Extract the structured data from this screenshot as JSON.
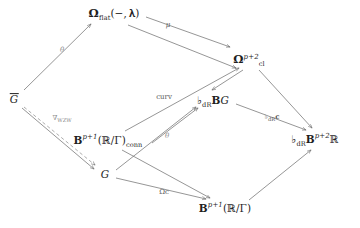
{
  "diagram": {
    "kind": "commutative-diagram",
    "nodes": [
      {
        "id": "omega-flat",
        "label": "Ω_flat(−, 𝔤)",
        "x": 114,
        "y": 14
      },
      {
        "id": "omega-cl",
        "label": "Ω^{p+2}_cl",
        "x": 249,
        "y": 60
      },
      {
        "id": "g-bar",
        "label": "Ḡ",
        "x": 14,
        "y": 99
      },
      {
        "id": "flat-dr-bg",
        "label": "♭_dR BG",
        "x": 213,
        "y": 100
      },
      {
        "id": "b-conn",
        "label": "B^{p+1}(ℝ/Γ)_conn",
        "x": 108,
        "y": 140
      },
      {
        "id": "flat-dr-b-p2-r",
        "label": "♭_dR B^{p+2}ℝ",
        "x": 315,
        "y": 139
      },
      {
        "id": "g-plain",
        "label": "G",
        "x": 105,
        "y": 174
      },
      {
        "id": "b-p1",
        "label": "B^{p+1}(ℝ/Γ)",
        "x": 225,
        "y": 208
      }
    ],
    "edges": [
      {
        "id": "theta-top",
        "from": "g-bar",
        "to": "omega-flat",
        "label": "θ",
        "style": "solid",
        "label_x": 62,
        "label_y": 50,
        "faint": true
      },
      {
        "id": "mu",
        "from": "omega-flat",
        "to": "omega-cl",
        "label": "μ",
        "style": "solid",
        "label_x": 168,
        "label_y": 25,
        "faint": false
      },
      {
        "id": "omegaflat-to-cl",
        "from": "omega-flat",
        "to": "omega-cl",
        "label": "",
        "style": "solid",
        "label_x": 0,
        "label_y": 0,
        "faint": false
      },
      {
        "id": "nabla-wzw",
        "from": "g-bar",
        "to": "b-conn",
        "label": "∇_WZW",
        "style": "dashed",
        "label_x": 62,
        "label_y": 118,
        "faint": true
      },
      {
        "id": "curv",
        "from": "b-conn",
        "to": "omega-cl",
        "label": "curv",
        "style": "solid",
        "label_x": 164,
        "label_y": 97,
        "faint": false
      },
      {
        "id": "theta-mid",
        "from": "b-conn",
        "to": "flat-dr-bg",
        "label": "θ",
        "style": "solid",
        "label_x": 167,
        "label_y": 136,
        "faint": true
      },
      {
        "id": "cl-to-flatbg",
        "from": "omega-cl",
        "to": "flat-dr-bg",
        "label": "",
        "style": "solid",
        "label_x": 0,
        "label_y": 0,
        "faint": false
      },
      {
        "id": "cl-to-bp2r",
        "from": "omega-cl",
        "to": "flat-dr-b-p2-r",
        "label": "",
        "style": "solid",
        "label_x": 0,
        "label_y": 0,
        "faint": false
      },
      {
        "id": "flat-dr-c",
        "from": "flat-dr-bg",
        "to": "flat-dr-b-p2-r",
        "label": "♭_dR c",
        "style": "solid",
        "label_x": 272,
        "label_y": 117,
        "faint": false
      },
      {
        "id": "gbar-to-g",
        "from": "g-bar",
        "to": "g-plain",
        "label": "",
        "style": "solid",
        "label_x": 0,
        "label_y": 0,
        "faint": false
      },
      {
        "id": "g-to-flatbg",
        "from": "g-plain",
        "to": "flat-dr-bg",
        "label": "",
        "style": "solid",
        "label_x": 0,
        "label_y": 0,
        "faint": false
      },
      {
        "id": "bconn-to-bp1",
        "from": "b-conn",
        "to": "b-p1",
        "label": "",
        "style": "solid",
        "label_x": 0,
        "label_y": 0,
        "faint": false
      },
      {
        "id": "omega-c",
        "from": "g-plain",
        "to": "b-p1",
        "label": "Ωc",
        "style": "solid",
        "label_x": 164,
        "label_y": 192,
        "faint": false
      },
      {
        "id": "bp1-to-bp2r",
        "from": "b-p1",
        "to": "flat-dr-b-p2-r",
        "label": "",
        "style": "solid",
        "label_x": 0,
        "label_y": 0,
        "faint": false
      }
    ],
    "symbols": {
      "omega": "Ω",
      "flat_sub": "flat",
      "gothic_g": "𝔤",
      "cl_sub": "cl",
      "exponent_p2": "p+2",
      "exponent_p1": "p+1",
      "reals": "ℝ",
      "gamma": "Γ",
      "conn_sub": "conn",
      "dr_sub": "dR",
      "flat_music": "♭",
      "bold_b": "B",
      "bold_c": "c",
      "letter_g": "G",
      "mu": "μ",
      "theta": "θ",
      "nabla": "∇",
      "wzw_sub": "WZW",
      "curv": "curv"
    },
    "colors": {
      "background": "#ffffff",
      "ink": "#1f1f1f",
      "edge": "#6d6d6d",
      "label": "#575757",
      "faint_label": "#8d8d8d"
    }
  }
}
